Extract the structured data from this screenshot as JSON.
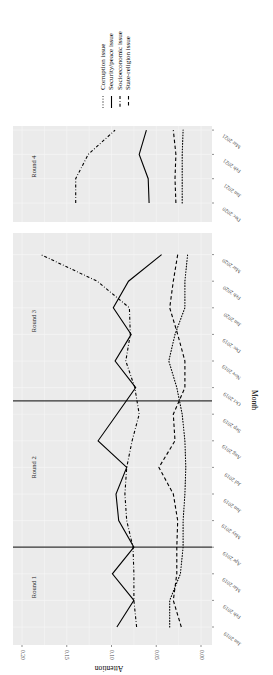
{
  "chart_data": {
    "type": "line",
    "orientation": "rotated-90-ccw",
    "xlabel": "Month",
    "ylabel": "Attention",
    "ylim": [
      0.0,
      0.2
    ],
    "yticks": [
      "0.00",
      "0.05",
      "0.10",
      "0.15",
      "0.20"
    ],
    "grid": true,
    "legend_position": "right",
    "legend": [
      {
        "name": "Corruption issue",
        "linestyle": "dotted"
      },
      {
        "name": "Security/peace issue",
        "linestyle": "solid"
      },
      {
        "name": "Socioeconomic issue",
        "linestyle": "dashdot"
      },
      {
        "name": "State-religion issue",
        "linestyle": "dashed"
      }
    ],
    "panels": [
      {
        "categories": [
          "Jan 2019",
          "Feb 2019",
          "Mar 2019",
          "Apr 2019",
          "May 2019",
          "Jun 2019",
          "Jul 2019",
          "Aug 2019",
          "Sep 2019",
          "Oct 2019",
          "Nov 2019",
          "Dec 2019",
          "Jan 2020",
          "Feb 2020",
          "Mar 2020"
        ],
        "round_labels": [
          {
            "label": "Round 1",
            "at": 1.5
          },
          {
            "label": "Round 2",
            "at": 6.0
          },
          {
            "label": "Round 3",
            "at": 11.5
          }
        ],
        "round_boundaries": [
          3,
          8.5
        ],
        "series": [
          {
            "name": "Corruption issue",
            "values": [
              0.035,
              0.035,
              0.023,
              0.02,
              0.02,
              0.018,
              0.017,
              0.018,
              0.021,
              0.027,
              0.036,
              0.029,
              0.018,
              0.018,
              0.015
            ]
          },
          {
            "name": "Security/peace issue",
            "values": [
              0.094,
              0.075,
              0.099,
              0.075,
              0.092,
              0.095,
              0.083,
              0.115,
              0.094,
              0.073,
              0.096,
              0.078,
              0.098,
              0.081,
              0.044
            ]
          },
          {
            "name": "Socioeconomic issue",
            "values": [
              0.072,
              0.075,
              0.075,
              0.076,
              0.083,
              0.085,
              0.083,
              0.077,
              0.069,
              0.074,
              0.084,
              0.079,
              0.08,
              0.116,
              0.179
            ]
          },
          {
            "name": "State-religion issue",
            "values": [
              0.022,
              0.031,
              0.027,
              0.027,
              0.026,
              0.031,
              0.047,
              0.029,
              0.031,
              0.018,
              0.018,
              0.026,
              0.035,
              0.031,
              0.026
            ]
          }
        ]
      },
      {
        "categories": [
          "Dec 2020",
          "Jan 2021",
          "Feb 2021",
          "Mar 2021"
        ],
        "round_labels": [
          {
            "label": "Round 4",
            "at": 1.5
          }
        ],
        "round_boundaries": [],
        "series": [
          {
            "name": "Corruption issue",
            "values": [
              0.021,
              0.021,
              0.021,
              0.02
            ]
          },
          {
            "name": "Security/peace issue",
            "values": [
              0.058,
              0.059,
              0.069,
              0.061
            ]
          },
          {
            "name": "Socioeconomic issue",
            "values": [
              0.14,
              0.14,
              0.126,
              0.096
            ]
          },
          {
            "name": "State-religion issue",
            "values": [
              0.028,
              0.029,
              0.028,
              0.031
            ]
          }
        ]
      }
    ]
  }
}
